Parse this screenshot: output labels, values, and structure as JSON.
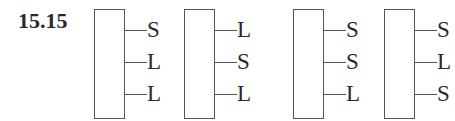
{
  "problem_label": "15.15",
  "structures": [
    {
      "x": 94,
      "substituents": [
        "S",
        "L",
        "L"
      ]
    },
    {
      "x": 184,
      "substituents": [
        "L",
        "S",
        "L"
      ]
    },
    {
      "x": 293,
      "substituents": [
        "S",
        "S",
        "L"
      ]
    },
    {
      "x": 384,
      "substituents": [
        "S",
        "L",
        "S"
      ]
    }
  ],
  "row_y": [
    30,
    62,
    94
  ]
}
